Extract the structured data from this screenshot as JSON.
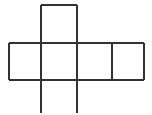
{
  "figure": {
    "name": "cube-net",
    "width": 152,
    "height": 115,
    "background_color": "#ffffff",
    "stroke_color": "#333333",
    "stroke_width": 2
  },
  "geometry": {
    "vertical_lines": [
      {
        "name": "left-edge",
        "x": 9,
        "y1": 43,
        "y2": 80
      },
      {
        "name": "crease-left",
        "x": 41,
        "y1": 5,
        "y2": 113
      },
      {
        "name": "crease-right",
        "x": 77,
        "y1": 5,
        "y2": 113
      },
      {
        "name": "divider-right",
        "x": 112,
        "y1": 43,
        "y2": 80
      },
      {
        "name": "right-edge",
        "x": 144,
        "y1": 43,
        "y2": 80
      }
    ],
    "horizontal_lines": [
      {
        "name": "top-square-top",
        "y": 5,
        "x1": 41,
        "x2": 77
      },
      {
        "name": "row-top",
        "y": 43,
        "x1": 9,
        "x2": 144
      },
      {
        "name": "row-bottom",
        "y": 80,
        "x1": 9,
        "x2": 144
      }
    ],
    "faces": [
      {
        "name": "face-top",
        "x": 41,
        "y": 5,
        "width": 36,
        "height": 38
      },
      {
        "name": "face-row-1",
        "x": 9,
        "y": 43,
        "width": 32,
        "height": 37
      },
      {
        "name": "face-row-2",
        "x": 41,
        "y": 43,
        "width": 36,
        "height": 37
      },
      {
        "name": "face-row-3",
        "x": 77,
        "y": 43,
        "width": 35,
        "height": 37
      },
      {
        "name": "face-row-4",
        "x": 112,
        "y": 43,
        "width": 32,
        "height": 37
      }
    ]
  },
  "labels": {
    "caption": ""
  }
}
